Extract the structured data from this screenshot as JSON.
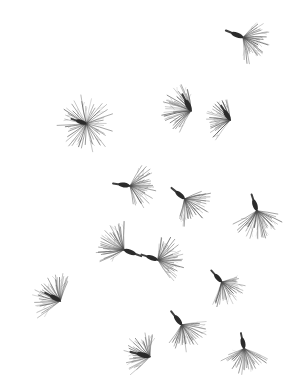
{
  "plate": {
    "width": 299,
    "height": 387,
    "background_color": "#ffffff",
    "ink_color": "#2b2b2b",
    "bristle_color": "#4a4a4a",
    "subject": "wind-dispersed seeds with pappus bristles",
    "specimen_count": 14,
    "caption": ""
  },
  "specimens": [
    {
      "id": "specimen-01",
      "name": "top-right-seed",
      "cx": 237,
      "cy": 35,
      "body_angle": 22,
      "body_length": 13,
      "body_width": 5.0,
      "bristle_count": 30,
      "bristle_length": 25,
      "spread_start": -52,
      "spread_end": 78,
      "scale": 1.0,
      "curve": 7
    },
    {
      "id": "specimen-02",
      "name": "upper-middle-seed",
      "cx": 188,
      "cy": 105,
      "body_angle": 62,
      "body_length": 13,
      "body_width": 5.0,
      "bristle_count": 32,
      "bristle_length": 27,
      "spread_start": 128,
      "spread_end": 272,
      "scale": 1.0,
      "curve": -8
    },
    {
      "id": "specimen-03",
      "name": "upper-right-seed",
      "cx": 227,
      "cy": 115,
      "body_angle": 58,
      "body_length": 12,
      "body_width": 4.6,
      "bristle_count": 28,
      "bristle_length": 24,
      "spread_start": 132,
      "spread_end": 268,
      "scale": 1.0,
      "curve": -6
    },
    {
      "id": "specimen-04",
      "name": "upper-left-radial-seed",
      "cx": 81,
      "cy": 122,
      "body_angle": 18,
      "body_length": 11,
      "body_width": 4.4,
      "bristle_count": 44,
      "bristle_length": 27,
      "spread_start": -175,
      "spread_end": 175,
      "scale": 1.0,
      "curve": 4
    },
    {
      "id": "specimen-05",
      "name": "center-left-seed",
      "cx": 124,
      "cy": 185,
      "body_angle": 8,
      "body_length": 12,
      "body_width": 4.8,
      "bristle_count": 30,
      "bristle_length": 24,
      "spread_start": -62,
      "spread_end": 70,
      "scale": 1.0,
      "curve": 6
    },
    {
      "id": "specimen-06",
      "name": "center-seed",
      "cx": 180,
      "cy": 195,
      "body_angle": 40,
      "body_length": 12,
      "body_width": 4.8,
      "bristle_count": 30,
      "bristle_length": 25,
      "spread_start": -30,
      "spread_end": 100,
      "scale": 1.0,
      "curve": 6
    },
    {
      "id": "specimen-07",
      "name": "right-middle-seed",
      "cx": 255,
      "cy": 205,
      "body_angle": 72,
      "body_length": 12,
      "body_width": 4.8,
      "bristle_count": 30,
      "bristle_length": 26,
      "spread_start": 8,
      "spread_end": 140,
      "scale": 1.0,
      "curve": 6
    },
    {
      "id": "specimen-08",
      "name": "center-pair-left-seed",
      "cx": 130,
      "cy": 252,
      "body_angle": 200,
      "body_length": 13,
      "body_width": 4.8,
      "bristle_count": 30,
      "bristle_length": 26,
      "spread_start": 140,
      "spread_end": 268,
      "scale": 1.0,
      "curve": 6
    },
    {
      "id": "specimen-09",
      "name": "center-pair-right-seed",
      "cx": 152,
      "cy": 258,
      "body_angle": 18,
      "body_length": 12,
      "body_width": 4.8,
      "bristle_count": 32,
      "bristle_length": 25,
      "spread_start": -78,
      "spread_end": 62,
      "scale": 1.0,
      "curve": -6
    },
    {
      "id": "specimen-10",
      "name": "right-lower-seed",
      "cx": 218,
      "cy": 278,
      "body_angle": 48,
      "body_length": 11,
      "body_width": 4.4,
      "bristle_count": 28,
      "bristle_length": 23,
      "spread_start": -24,
      "spread_end": 108,
      "scale": 1.0,
      "curve": 6
    },
    {
      "id": "specimen-11",
      "name": "left-lower-seed",
      "cx": 55,
      "cy": 298,
      "body_angle": 28,
      "body_length": 12,
      "body_width": 4.8,
      "bristle_count": 32,
      "bristle_length": 26,
      "spread_start": 140,
      "spread_end": 285,
      "scale": 1.0,
      "curve": 7
    },
    {
      "id": "specimen-12",
      "name": "bottom-center-seed",
      "cx": 178,
      "cy": 320,
      "body_angle": 52,
      "body_length": 12,
      "body_width": 4.8,
      "bristle_count": 30,
      "bristle_length": 25,
      "spread_start": -16,
      "spread_end": 116,
      "scale": 1.0,
      "curve": 6
    },
    {
      "id": "specimen-13",
      "name": "bottom-left-seed",
      "cx": 143,
      "cy": 355,
      "body_angle": 14,
      "body_length": 14,
      "body_width": 5.0,
      "bristle_count": 30,
      "bristle_length": 25,
      "spread_start": 128,
      "spread_end": 272,
      "scale": 1.0,
      "curve": 7
    },
    {
      "id": "specimen-14",
      "name": "bottom-right-seed",
      "cx": 243,
      "cy": 343,
      "body_angle": 78,
      "body_length": 11,
      "body_width": 4.6,
      "bristle_count": 30,
      "bristle_length": 25,
      "spread_start": 18,
      "spread_end": 152,
      "scale": 1.0,
      "curve": 6
    }
  ]
}
